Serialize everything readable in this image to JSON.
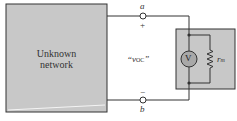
{
  "diagram": {
    "network_box": {
      "line1": "Unknown",
      "line2": "network",
      "fill": "#c8c8c8"
    },
    "terminal_a": {
      "label": "a",
      "polarity": "+"
    },
    "terminal_b": {
      "label": "b",
      "polarity": "−"
    },
    "voltage_label": "“v",
    "voltage_subscript": "OC",
    "voltage_close": "”",
    "meter": {
      "symbol": "V",
      "resistor_label": "r",
      "resistor_subscript": "m",
      "fill": "#c8c8c8",
      "circle_fill": "#a8a8a8"
    }
  }
}
